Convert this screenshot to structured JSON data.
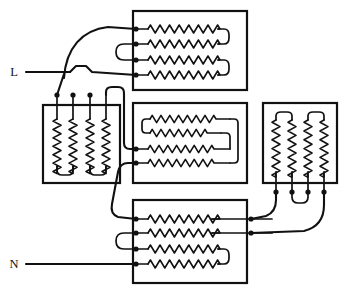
{
  "diagram": {
    "kind": "electrical-wiring-diagram",
    "canvas": {
      "width": 347,
      "height": 295
    },
    "colors": {
      "background": "#ffffff",
      "line": "#111111"
    },
    "supply_terminals": [
      {
        "id": "L",
        "label": "L",
        "label_x": 14,
        "label_y": 76,
        "wire_y": 72,
        "wire_x_start": 26,
        "wire_x_end": 133
      },
      {
        "id": "N",
        "label": "N",
        "label_x": 14,
        "label_y": 268,
        "wire_y": 264,
        "wire_x_start": 26,
        "wire_x_end": 133
      }
    ],
    "elements": [
      {
        "id": "top-bank",
        "name": "top-element-bank",
        "orientation": "horizontal",
        "x": 133,
        "y": 11,
        "w": 114,
        "h": 79,
        "coil_count": 4,
        "bridge": "right-pairs",
        "rows_y": [
          29,
          44,
          60,
          75
        ],
        "coil_x_start": 146,
        "coil_x_end": 218,
        "terminal_x": 136
      },
      {
        "id": "left-bank",
        "name": "left-element-bank",
        "orientation": "vertical",
        "x": 43,
        "y": 105,
        "w": 77,
        "h": 78,
        "coil_count": 4,
        "bridge": "bottom-pairs",
        "cols_x": [
          57,
          73,
          90,
          106
        ],
        "coil_y_start": 118,
        "coil_y_end": 166,
        "terminal_y": 95
      },
      {
        "id": "middle-bank",
        "name": "middle-serpentine-element",
        "orientation": "serpentine",
        "x": 133,
        "y": 103,
        "w": 114,
        "h": 80,
        "coil_count": 1,
        "bridge": "serpentine-fold",
        "rows_y": [
          119,
          133,
          149,
          163
        ],
        "terminal_x": 136
      },
      {
        "id": "right-bank",
        "name": "right-element-bank",
        "orientation": "vertical",
        "x": 263,
        "y": 103,
        "w": 74,
        "h": 80,
        "coil_count": 4,
        "bridge": "top-pairs",
        "cols_x": [
          276,
          292,
          308,
          324
        ],
        "coil_y_start": 120,
        "coil_y_end": 172,
        "terminal_y": 192
      },
      {
        "id": "bottom-bank",
        "name": "bottom-element-bank",
        "orientation": "horizontal",
        "x": 133,
        "y": 200,
        "w": 114,
        "h": 83,
        "coil_count": 4,
        "bridge": "right-pair-lower",
        "rows_y": [
          219,
          233,
          249,
          264
        ],
        "coil_x_start": 146,
        "coil_x_end": 218,
        "terminal_x": 136
      }
    ],
    "junction_dots": [
      {
        "name": "dot-top-row1",
        "x": 136,
        "y": 29
      },
      {
        "name": "dot-top-row2",
        "x": 136,
        "y": 44
      },
      {
        "name": "dot-top-row3",
        "x": 136,
        "y": 60
      },
      {
        "name": "dot-top-row4",
        "x": 136,
        "y": 75
      },
      {
        "name": "dot-left-col1",
        "x": 57,
        "y": 95
      },
      {
        "name": "dot-left-col2",
        "x": 73,
        "y": 95
      },
      {
        "name": "dot-left-col3",
        "x": 90,
        "y": 95
      },
      {
        "name": "dot-mid-row3",
        "x": 136,
        "y": 149
      },
      {
        "name": "dot-mid-row4",
        "x": 136,
        "y": 163
      },
      {
        "name": "dot-bottom-row1",
        "x": 136,
        "y": 219
      },
      {
        "name": "dot-bottom-row2",
        "x": 136,
        "y": 233
      },
      {
        "name": "dot-bottom-row3",
        "x": 136,
        "y": 249
      },
      {
        "name": "dot-bottom-row4",
        "x": 136,
        "y": 264
      },
      {
        "name": "dot-right-col1",
        "x": 276,
        "y": 192
      },
      {
        "name": "dot-right-col2",
        "x": 292,
        "y": 192
      },
      {
        "name": "dot-right-col3",
        "x": 308,
        "y": 192
      },
      {
        "name": "dot-right-col4",
        "x": 324,
        "y": 192
      },
      {
        "name": "dot-bottom-feed-1",
        "x": 251,
        "y": 219
      },
      {
        "name": "dot-bottom-feed-2",
        "x": 251,
        "y": 233
      }
    ]
  }
}
